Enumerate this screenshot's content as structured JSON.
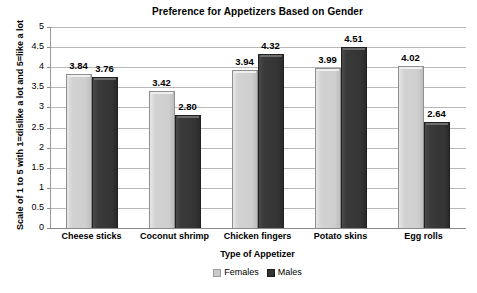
{
  "chart_data": {
    "type": "bar",
    "title": "Preference for Appetizers Based on Gender",
    "xlabel": "Type of Appetizer",
    "ylabel": "Scale of 1 to 5 with 1=dislike a lot and 5=like a lot",
    "ylim": [
      0,
      5
    ],
    "ytick_step": 0.5,
    "yticks": [
      "5",
      "4.5",
      "4",
      "3.5",
      "3",
      "2.5",
      "2",
      "1.5",
      "1",
      "0.5",
      "0"
    ],
    "grid": true,
    "legend_position": "bottom",
    "categories": [
      "Cheese sticks",
      "Coconut shrimp",
      "Chicken fingers",
      "Potato skins",
      "Egg rolls"
    ],
    "series": [
      {
        "name": "Females",
        "color": "#cfcfcf",
        "values": [
          3.84,
          3.42,
          3.94,
          3.99,
          4.02
        ],
        "labels": [
          "3.84",
          "3.42",
          "3.94",
          "3.99",
          "4.02"
        ]
      },
      {
        "name": "Males",
        "color": "#343434",
        "values": [
          3.76,
          2.8,
          4.32,
          4.51,
          2.64
        ],
        "labels": [
          "3.76",
          "2.80",
          "4.32",
          "4.51",
          "2.64"
        ]
      }
    ]
  }
}
